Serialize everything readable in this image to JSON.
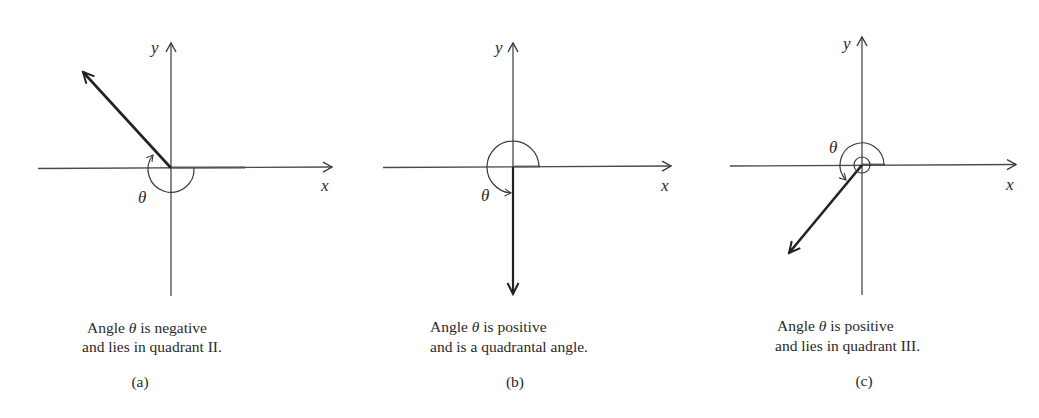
{
  "figure": {
    "panels": [
      {
        "id": "a",
        "label": "(a)",
        "caption_line1_pre": "Angle ",
        "caption_theta": "θ",
        "caption_line1_post": " is negative",
        "caption_line2": "and lies in quadrant II.",
        "x_axis_label": "x",
        "y_axis_label": "y",
        "angle_label": "θ",
        "sign": "negative",
        "terminal_quadrant": "II"
      },
      {
        "id": "b",
        "label": "(b)",
        "caption_line1_pre": "Angle ",
        "caption_theta": "θ",
        "caption_line1_post": " is positive",
        "caption_line2": "and is a quadrantal angle.",
        "x_axis_label": "x",
        "y_axis_label": "y",
        "angle_label": "θ",
        "sign": "positive",
        "terminal_quadrant": "quadrantal"
      },
      {
        "id": "c",
        "label": "(c)",
        "caption_line1_pre": "Angle ",
        "caption_theta": "θ",
        "caption_line1_post": " is positive",
        "caption_line2": "and lies in quadrant III.",
        "x_axis_label": "x",
        "y_axis_label": "y",
        "angle_label": "θ",
        "sign": "positive",
        "terminal_quadrant": "III"
      }
    ],
    "colors": {
      "axis": "#4a4a4a",
      "terminal_side": "#222222",
      "arc": "#3a3a3a",
      "text": "#2a2a2a",
      "background": "#ffffff"
    }
  }
}
